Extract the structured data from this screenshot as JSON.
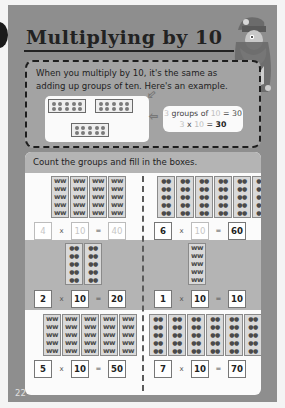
{
  "page": {
    "title": "Multiplying by 10",
    "page_number": "22"
  },
  "intro": {
    "text": "When you multiply by 10, it's the same as adding up groups of ten.  Here's an example.",
    "example": {
      "tenframes": 3,
      "dots_per_frame": 10,
      "line1": {
        "a": "3",
        "mid": " groups of ",
        "b": "10",
        "eq": " = 30"
      },
      "line2": {
        "a": "3",
        "x": " x ",
        "b": "10",
        "eq": " = ",
        "result": "30"
      }
    }
  },
  "exercise": {
    "instruction": "Count the groups and fill in the boxes.",
    "problems": [
      {
        "groups": "4",
        "times": "x",
        "ten": "10",
        "equals": "=",
        "answer": "40",
        "icon": "butterfly",
        "prefilled": false
      },
      {
        "groups": "6",
        "times": "x",
        "ten": "10",
        "equals": "=",
        "answer": "60",
        "icon": "ladybird",
        "prefilled": true
      },
      {
        "groups": "2",
        "times": "x",
        "ten": "10",
        "equals": "=",
        "answer": "20",
        "icon": "ladybird",
        "prefilled": true
      },
      {
        "groups": "1",
        "times": "x",
        "ten": "10",
        "equals": "=",
        "answer": "10",
        "icon": "butterfly",
        "prefilled": true
      },
      {
        "groups": "5",
        "times": "x",
        "ten": "10",
        "equals": "=",
        "answer": "50",
        "icon": "butterfly",
        "prefilled": true
      },
      {
        "groups": "7",
        "times": "x",
        "ten": "10",
        "equals": "=",
        "answer": "70",
        "icon": "ladybird",
        "prefilled": true
      }
    ]
  },
  "colors": {
    "page_bg": "#8e8e8e",
    "panel_white": "#fbfbfb",
    "panel_gray": "#b4b4b4",
    "text_dark": "#222222",
    "muted_placeholder": "#c6c6c6"
  }
}
